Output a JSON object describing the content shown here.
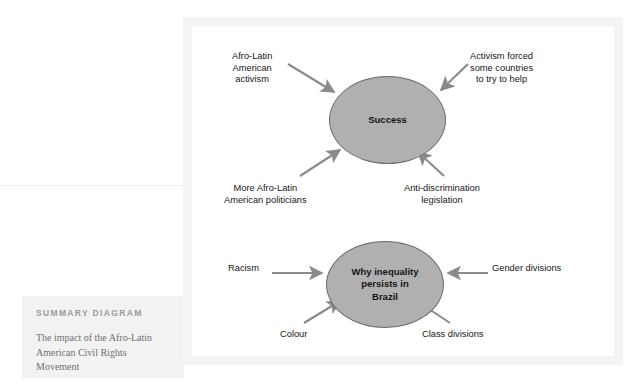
{
  "summary": {
    "kicker": "SUMMARY DIAGRAM",
    "caption_lines": [
      "The impact of the Afro-Latin",
      "American Civil Rights",
      "Movement"
    ]
  },
  "diagram": {
    "nodes": [
      {
        "id": "success",
        "label_lines": [
          "Success"
        ]
      },
      {
        "id": "inequality",
        "label_lines": [
          "Why inequality",
          "persists in",
          "Brazil"
        ]
      }
    ],
    "edges": [
      {
        "id": "afro-latin-activism",
        "target": "success",
        "direction": "into-node",
        "label_lines": [
          "Afro-Latin",
          "American",
          "activism"
        ]
      },
      {
        "id": "activism-forced",
        "target": "success",
        "direction": "into-node",
        "label_lines": [
          "Activism forced",
          "some countries",
          "to try to help"
        ]
      },
      {
        "id": "more-politicians",
        "target": "success",
        "direction": "into-node",
        "label_lines": [
          "More Afro-Latin",
          "American politicians"
        ]
      },
      {
        "id": "anti-discrimination",
        "target": "success",
        "direction": "into-node",
        "label_lines": [
          "Anti-discrimination",
          "legislation"
        ]
      },
      {
        "id": "racism",
        "target": "inequality",
        "direction": "into-node",
        "label_lines": [
          "Racism"
        ]
      },
      {
        "id": "gender-divisions",
        "target": "inequality",
        "direction": "into-node",
        "label_lines": [
          "Gender divisions"
        ]
      },
      {
        "id": "colour",
        "target": "inequality",
        "direction": "into-node",
        "label_lines": [
          "Colour"
        ]
      },
      {
        "id": "class-divisions",
        "target": "inequality",
        "direction": "into-node",
        "label_lines": [
          "Class divisions"
        ]
      }
    ]
  },
  "colors": {
    "node_fill": "#b0b0b0",
    "node_stroke": "#6e6e6e",
    "arrow": "#8a8a8a",
    "panel_frame": "#f4f4f4",
    "canvas": "#ffffff",
    "summary_band": "#f2f2f2",
    "kicker_text": "#9a9a9a",
    "caption_text": "#6f7073",
    "label_text": "#161616"
  }
}
